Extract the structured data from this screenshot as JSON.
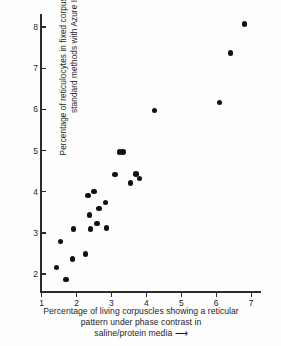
{
  "chart_data": {
    "type": "scatter",
    "title": "",
    "xlabel": "Percentage of living corpuscles showing a reticular pattern under phase contrast in saline/protein media →",
    "ylabel": "Percentage of reticulocytes in fixed corpuscles stained by standard methods with Azure II →",
    "xlim": [
      1,
      7.3
    ],
    "ylim": [
      1.55,
      8.3
    ],
    "xticks": [
      1,
      2,
      3,
      4,
      5,
      6,
      7
    ],
    "yticks": [
      2,
      3,
      4,
      5,
      6,
      7,
      8
    ],
    "xtick_labels": [
      "1",
      "2",
      "3",
      "4",
      "5",
      "6",
      "7"
    ],
    "ytick_labels": [
      "2",
      "3",
      "4",
      "5",
      "6",
      "7",
      "8"
    ],
    "grid": false,
    "legend": false,
    "marker": "filled-circle",
    "marker_color": "#101010",
    "points": [
      {
        "x": 1.45,
        "y": 2.15
      },
      {
        "x": 1.55,
        "y": 2.78
      },
      {
        "x": 1.72,
        "y": 1.85
      },
      {
        "x": 1.9,
        "y": 2.35
      },
      {
        "x": 1.93,
        "y": 3.08
      },
      {
        "x": 2.27,
        "y": 2.47
      },
      {
        "x": 2.35,
        "y": 3.9
      },
      {
        "x": 2.38,
        "y": 3.42
      },
      {
        "x": 2.42,
        "y": 3.08
      },
      {
        "x": 2.52,
        "y": 3.99
      },
      {
        "x": 2.6,
        "y": 3.22
      },
      {
        "x": 2.66,
        "y": 3.58
      },
      {
        "x": 2.85,
        "y": 3.72
      },
      {
        "x": 2.88,
        "y": 3.1
      },
      {
        "x": 3.12,
        "y": 4.4
      },
      {
        "x": 3.25,
        "y": 4.95
      },
      {
        "x": 3.35,
        "y": 4.95
      },
      {
        "x": 3.56,
        "y": 4.2
      },
      {
        "x": 3.72,
        "y": 4.42
      },
      {
        "x": 3.82,
        "y": 4.3
      },
      {
        "x": 4.25,
        "y": 5.96
      },
      {
        "x": 6.12,
        "y": 6.15
      },
      {
        "x": 6.42,
        "y": 7.35
      },
      {
        "x": 6.82,
        "y": 8.06
      }
    ]
  },
  "axis_titles": {
    "y_lines": [
      "Percentage of reticulocytes in fixed corpuscles stained by",
      "standard methods with Azure II ⟶"
    ],
    "x_lines": [
      "Percentage of living corpuscles showing a reticular",
      "pattern under phase contrast in",
      "saline/protein media ⟶"
    ]
  }
}
